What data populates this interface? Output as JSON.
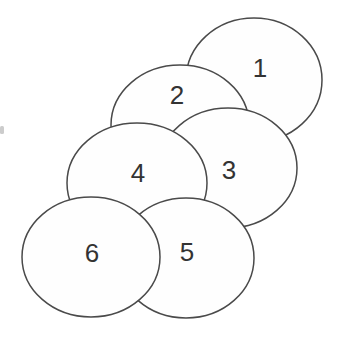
{
  "diagram": {
    "type": "overlapping-ellipses",
    "canvas": {
      "width": 350,
      "height": 337,
      "background_color": "#ffffff"
    },
    "style": {
      "ellipse_fill": "#fefefe",
      "ellipse_stroke": "#4a4a4a",
      "stroke_width": 1.5,
      "label_color": "#333333",
      "label_font_size": 26
    },
    "circles": [
      {
        "label": "1",
        "cx": 254,
        "cy": 80,
        "rx": 68,
        "ry": 62,
        "label_x": 260,
        "label_y": 68
      },
      {
        "label": "2",
        "cx": 180,
        "cy": 125,
        "rx": 69,
        "ry": 60,
        "label_x": 177,
        "label_y": 95
      },
      {
        "label": "3",
        "cx": 228,
        "cy": 168,
        "rx": 69,
        "ry": 60,
        "label_x": 229,
        "label_y": 170
      },
      {
        "label": "4",
        "cx": 137,
        "cy": 183,
        "rx": 70,
        "ry": 60,
        "label_x": 138,
        "label_y": 173
      },
      {
        "label": "5",
        "cx": 186,
        "cy": 258,
        "rx": 68,
        "ry": 60,
        "label_x": 187,
        "label_y": 252
      },
      {
        "label": "6",
        "cx": 91,
        "cy": 257,
        "rx": 69,
        "ry": 60,
        "label_x": 92,
        "label_y": 253
      }
    ],
    "stray_mark": {
      "x": 0,
      "y": 126,
      "width": 4,
      "height": 8,
      "color": "#cccccc"
    }
  }
}
